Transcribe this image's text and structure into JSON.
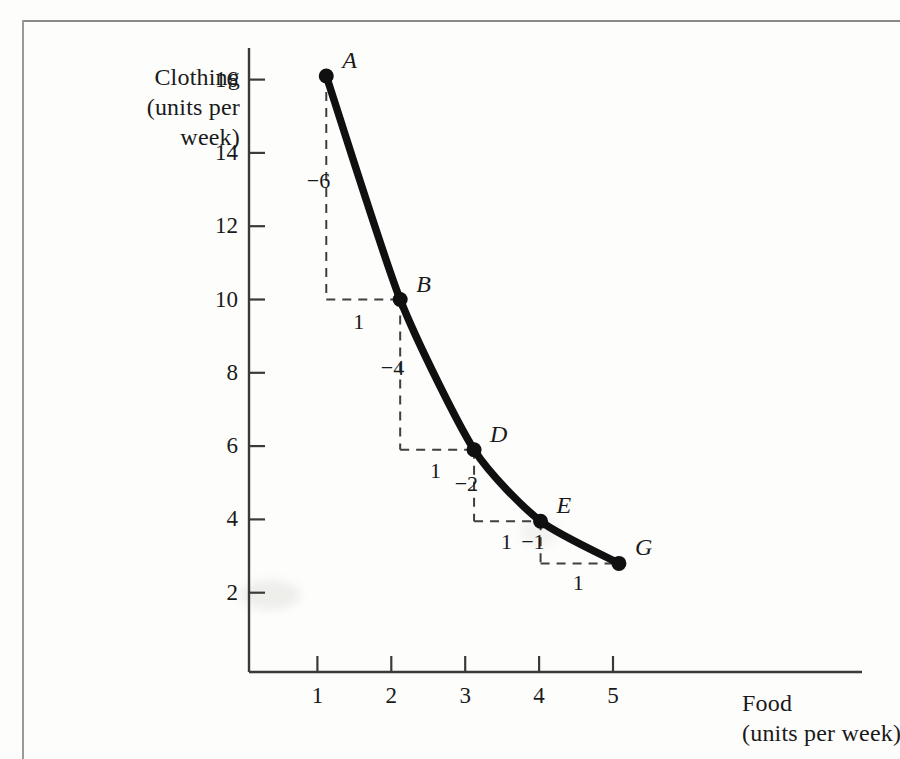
{
  "chart_data": {
    "type": "line",
    "title": "",
    "xlabel": "Food",
    "xlabel_sub": "(units per week)",
    "ylabel": "Clothing",
    "ylabel_sub_1": "(units per",
    "ylabel_sub_2": "week)",
    "xlim": [
      0,
      5.8
    ],
    "ylim": [
      0,
      17.4
    ],
    "x_ticks": [
      "1",
      "2",
      "3",
      "4",
      "5"
    ],
    "x_tick_values": [
      1,
      2,
      3,
      4,
      5
    ],
    "y_ticks": [
      "2",
      "4",
      "6",
      "8",
      "10",
      "12",
      "14",
      "16"
    ],
    "y_tick_values": [
      2,
      4,
      6,
      8,
      10,
      12,
      14,
      16
    ],
    "grid": false,
    "legend": "none",
    "series": [
      {
        "name": "indifference curve",
        "color": "#101010",
        "points": [
          {
            "label": "A",
            "x": 1.12,
            "y": 16.1
          },
          {
            "label": "B",
            "x": 2.12,
            "y": 10.0
          },
          {
            "label": "D",
            "x": 3.12,
            "y": 5.9
          },
          {
            "label": "E",
            "x": 4.02,
            "y": 3.95
          },
          {
            "label": "G",
            "x": 5.08,
            "y": 2.8
          }
        ]
      }
    ],
    "annotations": [
      {
        "name": "drop-a-to-b",
        "text": "-6",
        "x": 1.12,
        "y": 13.2
      },
      {
        "name": "run-a-to-b",
        "text": "1",
        "x": 1.58,
        "y": 9.35
      },
      {
        "name": "drop-b-to-d",
        "text": "-4",
        "x": 2.12,
        "y": 8.1
      },
      {
        "name": "run-b-to-d",
        "text": "1",
        "x": 2.62,
        "y": 5.3
      },
      {
        "name": "drop-d-to-e",
        "text": "-2",
        "x": 3.12,
        "y": 4.95
      },
      {
        "name": "run-d-to-e",
        "text": "1",
        "x": 3.58,
        "y": 3.35
      },
      {
        "name": "drop-e-to-g",
        "text": "-1",
        "x": 4.02,
        "y": 3.35
      },
      {
        "name": "run-e-to-g",
        "text": "1",
        "x": 4.55,
        "y": 2.25
      }
    ],
    "step_paths": [
      {
        "from": "A",
        "to": "B"
      },
      {
        "from": "B",
        "to": "D"
      },
      {
        "from": "D",
        "to": "E"
      },
      {
        "from": "E",
        "to": "G"
      }
    ]
  },
  "colors": {
    "curve": "#101010",
    "axis": "#3a3a3a",
    "dashed": "#3f3f3f",
    "frame": "#8a8a8a",
    "text": "#1a1a1a",
    "page": "#fdfdfc"
  }
}
